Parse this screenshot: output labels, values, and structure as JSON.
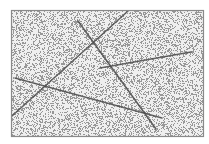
{
  "image": {
    "description": "Noisy grayscale image with straight line segments inside a rectangular frame",
    "background": "#ffffff",
    "frame": {
      "x": 11,
      "y": 10,
      "width": 193,
      "height": 127,
      "stroke": "#8a8a8a",
      "fill": "#efefef"
    },
    "noise": {
      "density": 0.32,
      "color": "#7a7a7a",
      "seed": 7
    },
    "line_color": "#4a4a4a",
    "lines": [
      {
        "name": "line-a",
        "x1": 128,
        "y1": 11,
        "x2": 12,
        "y2": 116,
        "width": 1.6
      },
      {
        "name": "line-b",
        "x1": 78,
        "y1": 21,
        "x2": 156,
        "y2": 129,
        "width": 1.6
      },
      {
        "name": "line-c",
        "x1": 100,
        "y1": 68,
        "x2": 191,
        "y2": 52,
        "width": 1.4
      },
      {
        "name": "line-d",
        "x1": 15,
        "y1": 78,
        "x2": 162,
        "y2": 118,
        "width": 1.5
      }
    ]
  }
}
